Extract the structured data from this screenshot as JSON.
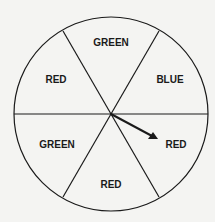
{
  "spinner": {
    "sections": [
      {
        "label": "GREEN",
        "x": 111,
        "y": 43
      },
      {
        "label": "BLUE",
        "x": 170,
        "y": 80
      },
      {
        "label": "RED",
        "x": 170,
        "y": 145
      },
      {
        "label": "RED",
        "x": 111,
        "y": 185
      },
      {
        "label": "GREEN",
        "x": 57,
        "y": 145
      },
      {
        "label": "RED",
        "x": 57,
        "y": 80
      }
    ],
    "pointer_points_to": "RED",
    "colors": {
      "line": "#1a1a1a",
      "background": "#f4f4f2"
    }
  }
}
